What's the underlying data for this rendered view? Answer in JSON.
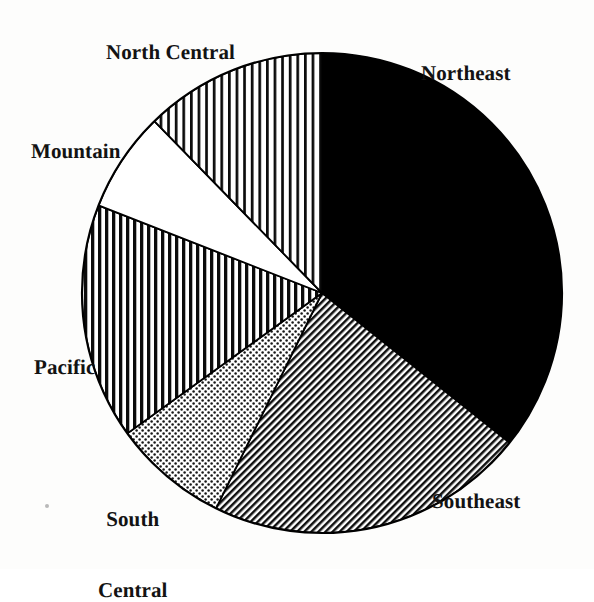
{
  "figure": {
    "kind": "pie-chart",
    "background_color": "#ffffff",
    "outline_color": "#000000",
    "center_x": 322,
    "center_y": 293,
    "radius": 240
  },
  "labels": {
    "northeast": "Northeast",
    "southeast": "Southeast",
    "south_central_line1": "South",
    "south_central_line2": "Central",
    "pacific": "Pacific",
    "mountain": "Mountain",
    "north_central": "North Central"
  },
  "chart_data": {
    "type": "pie",
    "title": "",
    "subtitle": "",
    "xlabel": "",
    "ylabel": "",
    "grid": false,
    "legend": "none",
    "labels_position": "outside",
    "start_angle_deg": 0,
    "direction": "clockwise",
    "units": "percent",
    "categories": [
      "Northeast",
      "Southeast",
      "South Central",
      "Pacific",
      "Mountain",
      "North Central"
    ],
    "values": [
      35.7,
      21.6,
      7.8,
      15.9,
      6.8,
      12.3
    ],
    "slices": [
      {
        "name": "Northeast",
        "value": 35.7,
        "start_deg": 0.0,
        "end_deg": 128.6,
        "sweep_deg": 128.6,
        "fill": "solid-black",
        "fill_color": "#000000",
        "label": "Northeast"
      },
      {
        "name": "Southeast",
        "value": 21.6,
        "start_deg": 128.6,
        "end_deg": 206.2,
        "sweep_deg": 77.6,
        "fill": "diagonal-hatch",
        "fill_color": "#4d4d4d",
        "label": "Southeast"
      },
      {
        "name": "South Central",
        "value": 7.8,
        "start_deg": 206.2,
        "end_deg": 234.2,
        "sweep_deg": 28.0,
        "fill": "dotted-stipple",
        "fill_color": "#8f8f8f",
        "label": "South Central"
      },
      {
        "name": "Pacific",
        "value": 15.9,
        "start_deg": 234.2,
        "end_deg": 291.4,
        "sweep_deg": 57.2,
        "fill": "vertical-stripes-dense",
        "fill_color": "#3b3b3b",
        "label": "Pacific"
      },
      {
        "name": "Mountain",
        "value": 6.8,
        "start_deg": 291.4,
        "end_deg": 315.7,
        "sweep_deg": 24.3,
        "fill": "blank-white",
        "fill_color": "#ffffff",
        "label": "Mountain"
      },
      {
        "name": "North Central",
        "value": 12.3,
        "start_deg": 315.7,
        "end_deg": 360.0,
        "sweep_deg": 44.3,
        "fill": "vertical-stripes-light",
        "fill_color": "#5a5a5a",
        "label": "North Central"
      }
    ]
  }
}
